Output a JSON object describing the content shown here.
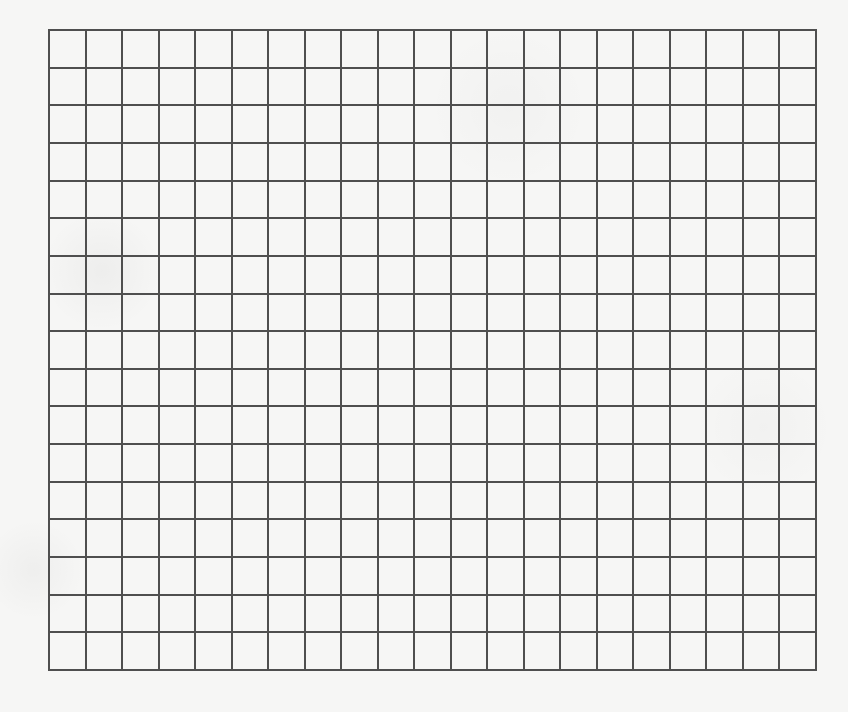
{
  "grid": {
    "rows": 17,
    "columns": 21,
    "line_color": "#4f4f4f",
    "background_color": "#f6f6f5",
    "cells": []
  }
}
